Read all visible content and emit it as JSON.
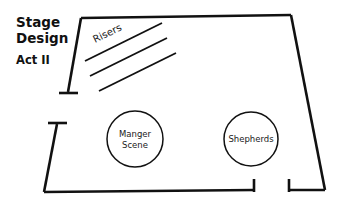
{
  "diagram": {
    "type": "stage-floor-plan",
    "background_color": "#ffffff",
    "line_color": "#111111",
    "heading": {
      "line1": "Stage",
      "line2": "Design",
      "subtitle": "Act II"
    },
    "features": {
      "risers_label": "Risers",
      "riser_line_count": 3
    },
    "circles": [
      {
        "id": "manger-scene",
        "label_line1": "Manger",
        "label_line2": "Scene",
        "cx": 135,
        "cy": 139,
        "r": 28
      },
      {
        "id": "shepherds",
        "label_line1": "Shepherds",
        "label_line2": "",
        "cx": 251,
        "cy": 139,
        "r": 27
      }
    ],
    "walls": {
      "top": "top-wall",
      "left_upper": "left-upper-wall",
      "left_lower": "left-lower-wall",
      "bottom_main": "bottom-wall",
      "bottom_right": "bottom-right-wall",
      "right": "right-wall"
    }
  }
}
